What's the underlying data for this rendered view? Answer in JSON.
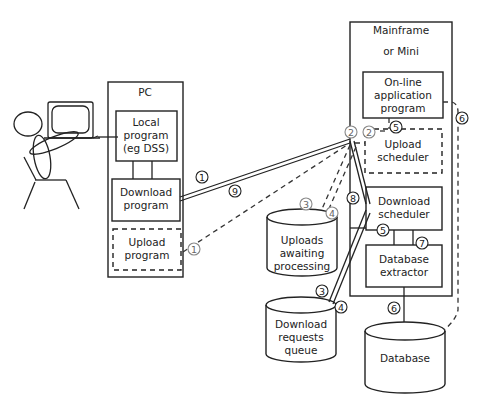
{
  "diagram": {
    "pc": {
      "title": "PC",
      "local_program": [
        "Local",
        "program",
        "(eg DSS)"
      ],
      "download_program": [
        "Download",
        "program"
      ],
      "upload_program": [
        "Upload",
        "program"
      ]
    },
    "mainframe": {
      "title_line1": "Mainframe",
      "title_line2": "or Mini",
      "online_app": [
        "On-line",
        "application",
        "program"
      ],
      "upload_scheduler": [
        "Upload",
        "scheduler"
      ],
      "download_scheduler": [
        "Download",
        "scheduler"
      ],
      "database_extractor": [
        "Database",
        "extractor"
      ]
    },
    "stores": {
      "uploads_awaiting": [
        "Uploads",
        "awaiting",
        "processing"
      ],
      "download_requests": [
        "Download",
        "requests",
        "queue"
      ],
      "database": "Database"
    },
    "steps": {
      "s1": "1",
      "s1u": "1",
      "s2": "2",
      "s2u": "2",
      "s3a": "3",
      "s4a": "4",
      "s3b": "3",
      "s4b": "4",
      "s5a": "5",
      "s5b": "5",
      "s6a": "6",
      "s6b": "6",
      "s7": "7",
      "s8": "8",
      "s9": "9"
    }
  }
}
